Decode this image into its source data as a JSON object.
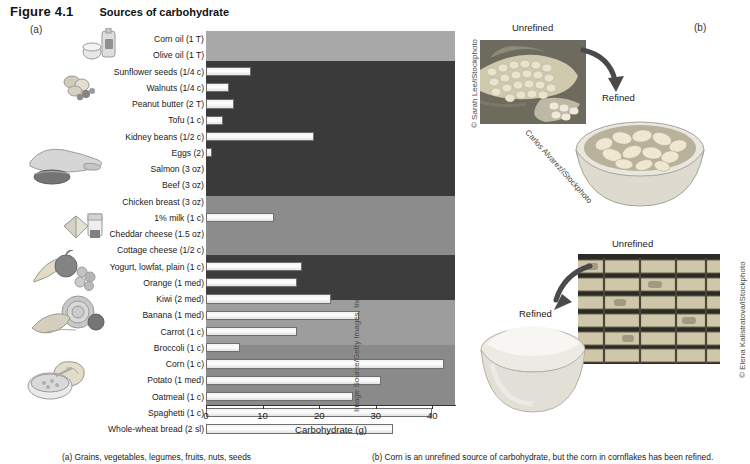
{
  "figure": {
    "number": "Figure 4.1",
    "title": "Sources of carbohydrate",
    "panel_a_label": "(a)",
    "panel_b_label": "(b)"
  },
  "chart_data": {
    "type": "bar",
    "orientation": "horizontal",
    "title": "Sources of carbohydrate",
    "xlabel": "Carbohydrate (g)",
    "ylabel": "",
    "xlim": [
      0,
      44
    ],
    "xticks": [
      0,
      10,
      20,
      30,
      40
    ],
    "xtick_labels": [
      "0",
      "10",
      "20",
      "30",
      "40"
    ],
    "grid": false,
    "legend": "none",
    "categories": [
      "Corn oil (1 T)",
      "Olive oil (1 T)",
      "Sunflower seeds (1/4 c)",
      "Walnuts (1/4 c)",
      "Peanut butter (2 T)",
      "Tofu (1 c)",
      "Kidney beans (1/2 c)",
      "Eggs (2)",
      "Salmon (3 oz)",
      "Beef (3 oz)",
      "Chicken breast (3 oz)",
      "1% milk (1 c)",
      "Cheddar cheese (1.5 oz)",
      "Cottage cheese (1/2 c)",
      "Yogurt, lowfat, plain (1 c)",
      "Orange (1 med)",
      "Kiwi (2 med)",
      "Banana (1 med)",
      "Carrot (1 c)",
      "Broccoli (1 c)",
      "Corn (1 c)",
      "Potato (1 med)",
      "Oatmeal (1 c)",
      "Spaghetti (1 c)",
      "Whole-wheat bread (2 sl)"
    ],
    "values": [
      0,
      0,
      8,
      4,
      5,
      3,
      19,
      1,
      0,
      0,
      0,
      12,
      0,
      0,
      17,
      16,
      22,
      27,
      16,
      6,
      42,
      31,
      26,
      40,
      33
    ],
    "band_groups": [
      {
        "name": "fats-oils",
        "rows": [
          0,
          1
        ],
        "shade": "#a8a8a8"
      },
      {
        "name": "protein-foods",
        "rows": [
          2,
          10
        ],
        "shade": "#3a3a3a"
      },
      {
        "name": "dairy",
        "rows": [
          11,
          14
        ],
        "shade": "#8c8c8c"
      },
      {
        "name": "fruits",
        "rows": [
          15,
          17
        ],
        "shade": "#3d3d3d"
      },
      {
        "name": "vegetables",
        "rows": [
          18,
          20
        ],
        "shade": "#9d9d9d"
      },
      {
        "name": "grains",
        "rows": [
          21,
          24
        ],
        "shade": "#8a8a8a"
      }
    ]
  },
  "photos": {
    "corn": {
      "unrefined_label": "Unrefined",
      "refined_label": "Refined",
      "credit_source": "© Sarah Lee/iStockphoto",
      "credit_bowl": "Carlos Alvarez/iStockphoto"
    },
    "cane": {
      "unrefined_label": "Unrefined",
      "refined_label": "Refined",
      "credit_source": "© Elena Kalistratova/iStockphoto",
      "credit_bowl": "Image Source/Getty Images, Inc."
    }
  },
  "captions": {
    "a": "(a) Grains, vegetables, legumes, fruits, nuts, seeds",
    "b": "(b) Corn is an unrefined source of carbohydrate, but the corn in cornflakes has been refined."
  }
}
